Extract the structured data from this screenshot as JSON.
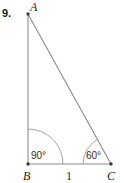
{
  "figure": {
    "problem_number": "9.",
    "kind": "right-triangle-diagram",
    "vertices": [
      {
        "name": "A",
        "label": "A",
        "x": 28,
        "y": 14,
        "label_x": 30,
        "label_y": 11
      },
      {
        "name": "B",
        "label": "B",
        "x": 28,
        "y": 164,
        "label_x": 23,
        "label_y": 180
      },
      {
        "name": "C",
        "label": "C",
        "x": 111,
        "y": 164,
        "label_x": 107,
        "label_y": 180
      }
    ],
    "sides": [
      {
        "name": "AB",
        "from": "A",
        "to": "B",
        "label": ""
      },
      {
        "name": "BC",
        "from": "B",
        "to": "C",
        "label": "1",
        "label_x": 66,
        "label_y": 180
      },
      {
        "name": "CA",
        "from": "C",
        "to": "A",
        "label": ""
      }
    ],
    "angles": [
      {
        "at": "B",
        "label": "90°",
        "value": 90,
        "arc_radius": 35,
        "label_x": 31,
        "label_y": 159
      },
      {
        "at": "C",
        "label": "60°",
        "value": 60,
        "arc_radius": 28,
        "label_x": 86,
        "label_y": 159
      }
    ],
    "colors": {
      "background": "#ffffff",
      "side_stroke": "#8c8c8c",
      "arc_stroke": "#a6a6a6",
      "text": "#1f1f1f",
      "number_text": "#1a1a1a"
    }
  }
}
